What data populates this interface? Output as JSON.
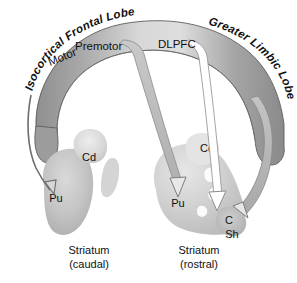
{
  "figure": {
    "background_color": "#ffffff"
  },
  "arc": {
    "left_label": "Isocortical Frontal Lobe",
    "right_label": "Greater Limbic Lobe",
    "band_fill_left": "#9a9a9a",
    "band_fill_mid": "#d6d6d6",
    "band_fill_right": "#8f8f8f",
    "band_stroke": "#5a5a5a"
  },
  "cortical_regions": [
    {
      "id": "motor",
      "label": "Motor"
    },
    {
      "id": "premotor",
      "label": "Premotor"
    },
    {
      "id": "dlpfc",
      "label": "DLPFC"
    }
  ],
  "striata": [
    {
      "id": "caudal",
      "caption_line1": "Striatum",
      "caption_line2": "(caudal)",
      "nuclei": [
        {
          "id": "cd-caudal",
          "label": "Cd"
        },
        {
          "id": "pu-caudal",
          "label": "Pu"
        }
      ]
    },
    {
      "id": "rostral",
      "caption_line1": "Striatum",
      "caption_line2": "(rostral)",
      "nuclei": [
        {
          "id": "cd-rostral",
          "label": "Cd"
        },
        {
          "id": "pu-rostral",
          "label": "Pu"
        },
        {
          "id": "core-rostral",
          "label": "C"
        },
        {
          "id": "shell-rostral",
          "label": "Sh"
        }
      ]
    }
  ],
  "projections": [
    {
      "id": "motor-to-pu-caudal",
      "from": "Motor",
      "to": "Pu",
      "style": "thin-dark-line",
      "color": "#6b6b6b"
    },
    {
      "id": "premotor-to-pu-rostral",
      "from": "Premotor",
      "to": "Pu",
      "style": "gray-band",
      "color": "#b9b9b9"
    },
    {
      "id": "dlpfc-to-core",
      "from": "DLPFC",
      "to": "C",
      "style": "hollow-outline",
      "color": "#ffffff"
    },
    {
      "id": "limbic-to-shell",
      "from": "Greater Limbic Lobe",
      "to": "Sh",
      "style": "gray-band",
      "color": "#b3b3b3"
    }
  ],
  "colors": {
    "striatum_light": "#e2e2e2",
    "striatum_mid": "#cfcfcf",
    "striatum_dark": "#b4b4b4",
    "text": "#111111"
  }
}
